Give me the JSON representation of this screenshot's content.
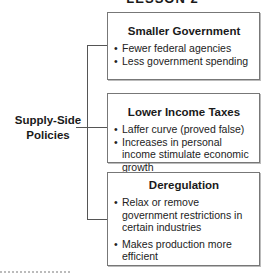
{
  "header": {
    "title": "LESSON 2"
  },
  "diagram": {
    "root": {
      "label": "Supply-Side Policies"
    },
    "branches": [
      {
        "title": "Smaller Government",
        "items": [
          "Fewer federal agencies",
          "Less government spending"
        ]
      },
      {
        "title": "Lower Income Taxes",
        "items": [
          "Laffer curve (proved false)",
          "Increases in personal income stimulate economic growth"
        ]
      },
      {
        "title": "Deregulation",
        "items": [
          "Relax or remove government restrictions in certain industries",
          "Makes production more efficient"
        ]
      }
    ]
  }
}
